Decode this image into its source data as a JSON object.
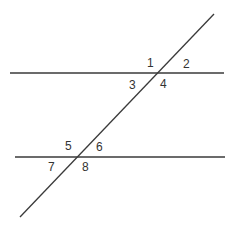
{
  "diagram": {
    "type": "parallel-lines-cut-by-transversal",
    "line_color": "#3a3a3a",
    "text_color": "#333333",
    "lines": {
      "top": {
        "x1": 10,
        "y1": 73,
        "x2": 224,
        "y2": 73
      },
      "bottom": {
        "x1": 15,
        "y1": 157,
        "x2": 225,
        "y2": 157
      },
      "transversal": {
        "x1": 214,
        "y1": 14,
        "x2": 20,
        "y2": 217
      }
    },
    "angle_labels": [
      {
        "text": "1",
        "x": 147,
        "y": 67
      },
      {
        "text": "2",
        "x": 183,
        "y": 68
      },
      {
        "text": "3",
        "x": 129,
        "y": 89
      },
      {
        "text": "4",
        "x": 160,
        "y": 88
      },
      {
        "text": "5",
        "x": 65,
        "y": 150
      },
      {
        "text": "6",
        "x": 96,
        "y": 151
      },
      {
        "text": "7",
        "x": 48,
        "y": 171
      },
      {
        "text": "8",
        "x": 82,
        "y": 171
      }
    ]
  }
}
